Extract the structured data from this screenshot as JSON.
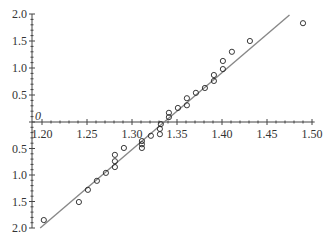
{
  "chart_data": {
    "type": "scatter",
    "title": "",
    "xlabel": "",
    "ylabel": "",
    "origin_label": "0",
    "xlim": [
      1.2,
      1.5
    ],
    "x_ticks": [
      "1.20",
      "1.25",
      "1.30",
      "1.35",
      "1.40",
      "1.45",
      "1.50"
    ],
    "y_ticks_upper": [
      "2.0",
      "1.5",
      "1.0",
      "0.5"
    ],
    "y_ticks_lower": [
      "0.5",
      "1.0",
      "1.5",
      "2.0"
    ],
    "ylim": [
      -2.0,
      2.0
    ],
    "grid": false,
    "legend": null,
    "series": [
      {
        "name": "observations",
        "marker": "open-circle",
        "points": [
          {
            "x": 1.202,
            "y": -1.85
          },
          {
            "x": 1.241,
            "y": -1.51
          },
          {
            "x": 1.251,
            "y": -1.28
          },
          {
            "x": 1.261,
            "y": -1.11
          },
          {
            "x": 1.271,
            "y": -0.96
          },
          {
            "x": 1.281,
            "y": -0.85
          },
          {
            "x": 1.281,
            "y": -0.74
          },
          {
            "x": 1.281,
            "y": -0.62
          },
          {
            "x": 1.291,
            "y": -0.49
          },
          {
            "x": 1.311,
            "y": -0.49
          },
          {
            "x": 1.311,
            "y": -0.42
          },
          {
            "x": 1.311,
            "y": -0.36
          },
          {
            "x": 1.321,
            "y": -0.26
          },
          {
            "x": 1.331,
            "y": -0.23
          },
          {
            "x": 1.331,
            "y": -0.13
          },
          {
            "x": 1.332,
            "y": -0.04
          },
          {
            "x": 1.341,
            "y": 0.09
          },
          {
            "x": 1.341,
            "y": 0.17
          },
          {
            "x": 1.351,
            "y": 0.26
          },
          {
            "x": 1.361,
            "y": 0.31
          },
          {
            "x": 1.361,
            "y": 0.44
          },
          {
            "x": 1.371,
            "y": 0.54
          },
          {
            "x": 1.381,
            "y": 0.63
          },
          {
            "x": 1.391,
            "y": 0.76
          },
          {
            "x": 1.391,
            "y": 0.87
          },
          {
            "x": 1.401,
            "y": 0.98
          },
          {
            "x": 1.401,
            "y": 1.13
          },
          {
            "x": 1.411,
            "y": 1.3
          },
          {
            "x": 1.431,
            "y": 1.5
          },
          {
            "x": 1.49,
            "y": 1.83
          }
        ]
      }
    ],
    "fit_line": {
      "x": [
        1.198,
        1.475
      ],
      "y": [
        -2.0,
        1.98
      ]
    }
  }
}
